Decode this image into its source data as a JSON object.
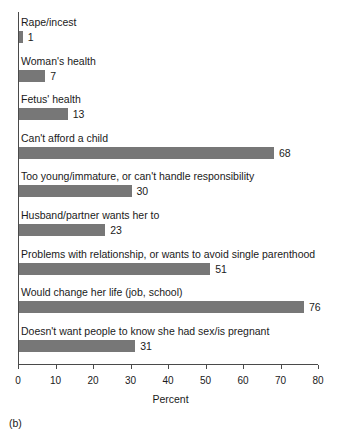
{
  "figure": {
    "caption": "(b)",
    "axis_title": "Percent",
    "bar_color": "#777777",
    "axis_color": "#4a4a4a",
    "background": "#ffffff"
  },
  "chart_data": {
    "type": "bar",
    "orientation": "horizontal",
    "title": "",
    "subtitle": "",
    "xlabel": "Percent",
    "ylabel": "",
    "xlim": [
      0,
      80
    ],
    "ylim": null,
    "grid": false,
    "legend": null,
    "xticks": [
      0,
      10,
      20,
      30,
      40,
      50,
      60,
      70,
      80
    ],
    "xtick_labels": [
      "0",
      "10",
      "20",
      "30",
      "40",
      "50",
      "60",
      "70",
      "80"
    ],
    "value_labels_shown": true,
    "categories": [
      "Rape/incest",
      "Woman's health",
      "Fetus' health",
      "Can't afford a child",
      "Too young/immature, or can't handle responsibility",
      "Husband/partner wants her to",
      "Problems with relationship, or wants to avoid single parenthood",
      "Would change her life (job, school)",
      "Doesn't want people to know she had sex/is pregnant"
    ],
    "values": [
      1,
      7,
      13,
      68,
      30,
      23,
      51,
      76,
      31
    ],
    "value_labels": [
      "1",
      "7",
      "13",
      "68",
      "30",
      "23",
      "51",
      "76",
      "31"
    ],
    "bars": [
      {
        "label": "Rape/incest",
        "value": 1,
        "value_label": "1"
      },
      {
        "label": "Woman's health",
        "value": 7,
        "value_label": "7"
      },
      {
        "label": "Fetus' health",
        "value": 13,
        "value_label": "13"
      },
      {
        "label": "Can't afford a child",
        "value": 68,
        "value_label": "68"
      },
      {
        "label": "Too young/immature, or can't handle responsibility",
        "value": 30,
        "value_label": "30"
      },
      {
        "label": "Husband/partner wants her to",
        "value": 23,
        "value_label": "23"
      },
      {
        "label": "Problems with relationship, or wants to avoid single parenthood",
        "value": 51,
        "value_label": "51"
      },
      {
        "label": "Would change her life (job, school)",
        "value": 76,
        "value_label": "76"
      },
      {
        "label": "Doesn't want people to know she had sex/is pregnant",
        "value": 31,
        "value_label": "31"
      }
    ]
  }
}
